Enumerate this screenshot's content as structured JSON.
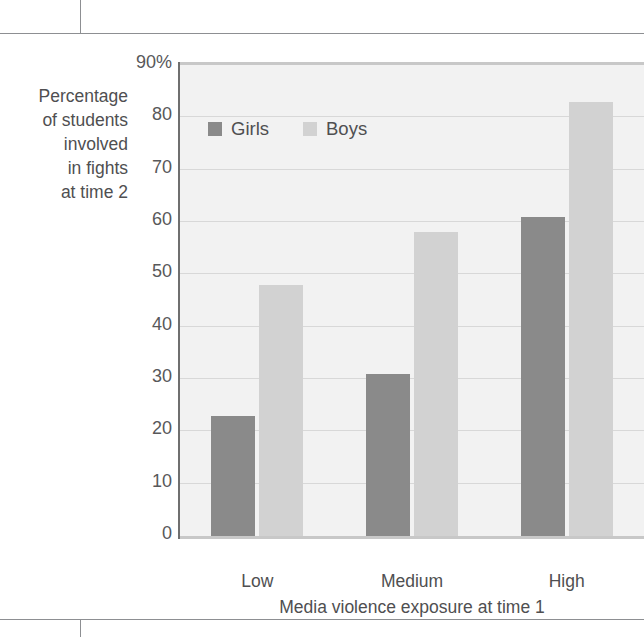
{
  "figure": {
    "y_axis_title": "Percentage\nof students\ninvolved\nin fights\nat time 2",
    "y_axis_title_lines": [
      "Percentage",
      "of students",
      "involved",
      "in fights",
      "at time 2"
    ],
    "x_axis_title": "Media violence exposure at time 1",
    "y_tick_labels": [
      "90%",
      "80",
      "70",
      "60",
      "50",
      "40",
      "30",
      "20",
      "10",
      "0"
    ],
    "legend": {
      "items": [
        {
          "label": "Girls",
          "color": "#8a8a8a",
          "swatch_icon": "square-swatch-icon"
        },
        {
          "label": "Boys",
          "color": "#d2d2d2",
          "swatch_icon": "square-swatch-icon"
        }
      ]
    }
  },
  "chart_data": {
    "type": "bar",
    "title": "",
    "subtitle": "",
    "categories": [
      "Low",
      "Medium",
      "High"
    ],
    "series": [
      {
        "name": "Girls",
        "color": "#8a8a8a",
        "values": [
          23,
          31,
          61
        ]
      },
      {
        "name": "Boys",
        "color": "#d2d2d2",
        "values": [
          48,
          58,
          83
        ]
      }
    ],
    "xlabel": "Media violence exposure at time 1",
    "ylabel": "Percentage of students involved in fights at time 2",
    "ylim": [
      0,
      90
    ],
    "ytick_values": [
      0,
      10,
      20,
      30,
      40,
      50,
      60,
      70,
      80,
      90
    ],
    "ytick_labels": [
      "0",
      "10",
      "20",
      "30",
      "40",
      "50",
      "60",
      "70",
      "80",
      "90%"
    ],
    "grid": true,
    "grid_axis": "y",
    "legend_position": "inside-top-left",
    "units": "percent"
  },
  "colors": {
    "girls": "#8a8a8a",
    "boys": "#d2d2d2",
    "plot_background": "#f2f2f2",
    "gridline": "#d8d8d8",
    "text": "#4f4f51",
    "rule": "#8d8f92"
  }
}
